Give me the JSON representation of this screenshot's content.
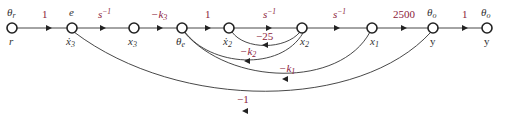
{
  "diagram": {
    "type": "signal-flow-graph",
    "nodes": [
      {
        "id": "r",
        "top_label": "θr",
        "bottom_label": "r",
        "x": 12,
        "y": 28
      },
      {
        "id": "x3dot",
        "top_label": "e",
        "bottom_label": "ẋ3",
        "x": 72,
        "y": 28
      },
      {
        "id": "x3",
        "top_label": "",
        "bottom_label": "x3",
        "x": 134,
        "y": 28
      },
      {
        "id": "thetae",
        "top_label": "",
        "bottom_label": "θe",
        "x": 182,
        "y": 28
      },
      {
        "id": "x2dot",
        "top_label": "",
        "bottom_label": "ẋ2",
        "x": 229,
        "y": 28
      },
      {
        "id": "x2",
        "top_label": "",
        "bottom_label": "x2",
        "x": 302,
        "y": 28
      },
      {
        "id": "x1",
        "top_label": "",
        "bottom_label": "x1",
        "x": 372,
        "y": 28
      },
      {
        "id": "y",
        "top_label": "θo",
        "bottom_label": "y",
        "x": 433,
        "y": 28
      },
      {
        "id": "yout",
        "top_label": "θo",
        "bottom_label": "y",
        "x": 487,
        "y": 28
      }
    ],
    "forward_branches": [
      {
        "from": "r",
        "to": "x3dot",
        "gain": "1"
      },
      {
        "from": "x3dot",
        "to": "x3",
        "gain": "s^-1"
      },
      {
        "from": "x3",
        "to": "thetae",
        "gain": "-k3"
      },
      {
        "from": "thetae",
        "to": "x2dot",
        "gain": "1"
      },
      {
        "from": "x2dot",
        "to": "x2",
        "gain": "s^-1"
      },
      {
        "from": "x2",
        "to": "x1",
        "gain": "s^-1"
      },
      {
        "from": "x1",
        "to": "y",
        "gain": "2500"
      },
      {
        "from": "y",
        "to": "yout",
        "gain": "1"
      }
    ],
    "feedback_branches": [
      {
        "from": "x2",
        "to": "x2dot",
        "gain": "-25"
      },
      {
        "from": "x2",
        "to": "thetae",
        "gain": "-k2"
      },
      {
        "from": "x1",
        "to": "thetae",
        "gain": "-k1"
      },
      {
        "from": "y",
        "to": "x3dot",
        "gain": "-1"
      }
    ],
    "labels": {
      "g_r_e": "1",
      "g_e_x3": "s",
      "g_e_x3_sup": "−1",
      "g_x3_te": "−k",
      "g_x3_te_sub": "3",
      "g_te_x2d": "1",
      "g_x2d_x2": "s",
      "g_x2d_x2_sup": "−1",
      "g_x2_x1": "s",
      "g_x2_x1_sup": "−1",
      "g_x1_y": "2500",
      "g_y_out": "1",
      "g_fb_25": "−25",
      "g_fb_k2": "−k",
      "g_fb_k2_sub": "2",
      "g_fb_k1": "−k",
      "g_fb_k1_sub": "1",
      "g_fb_1": "−1",
      "n_r_top": "θ",
      "n_r_top_sub": "r",
      "n_r_bot": "r",
      "n_e_top": "e",
      "n_x3dot_bot": "ẋ",
      "n_x3dot_bot_sub": "3",
      "n_x3_bot": "x",
      "n_x3_bot_sub": "3",
      "n_te_bot": "θ",
      "n_te_bot_sub": "e",
      "n_x2dot_bot": "ẋ",
      "n_x2dot_bot_sub": "2",
      "n_x2_bot": "x",
      "n_x2_bot_sub": "2",
      "n_x1_bot": "x",
      "n_x1_bot_sub": "1",
      "n_y_top": "θ",
      "n_y_top_sub": "o",
      "n_y_bot": "y",
      "n_yout_top": "θ",
      "n_yout_top_sub": "o",
      "n_yout_bot": "y"
    },
    "colors": {
      "gain_text": "#8b1a3a",
      "line": "#333333",
      "node_stroke": "#222222"
    }
  }
}
